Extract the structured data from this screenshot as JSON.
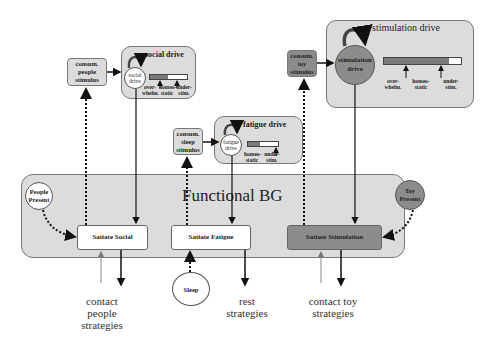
{
  "functional_bg": {
    "title": "Functional BG"
  },
  "social": {
    "stimulus_box": "consum. people stimulus",
    "panel_title": "social drive",
    "drive_circle": "social drive",
    "bar_labels": [
      "over-whelm.",
      "homeo-static",
      "under-stim."
    ],
    "bar_fill_pct": 50,
    "presence": "People Present",
    "action": "Satiate Social",
    "strategy": "contact people strategies"
  },
  "fatigue": {
    "stimulus_box": "consum. sleep stimulus",
    "panel_title": "fatigue drive",
    "drive_circle": "fatigue drive",
    "bar_labels": [
      "homeo-static",
      "under-stim."
    ],
    "bar_fill_pct": 40,
    "presence": "Sleep",
    "action": "Satiate Fatigue",
    "strategy": "rest strategies"
  },
  "stimulation": {
    "stimulus_box": "consum. toy stimulus",
    "panel_title": "stimulation drive",
    "drive_circle": "stimulation drive",
    "bar_labels": [
      "over-whelm.",
      "homeo-static",
      "under-stim."
    ],
    "bar_fill_pct": 85,
    "presence": "Toy Present",
    "action": "Satiate Stimulation",
    "strategy": "contact toy strategies"
  },
  "colors": {
    "panel_fill": "#dcdcdc",
    "dark_fill": "#8c8c8c",
    "border": "#777777"
  }
}
